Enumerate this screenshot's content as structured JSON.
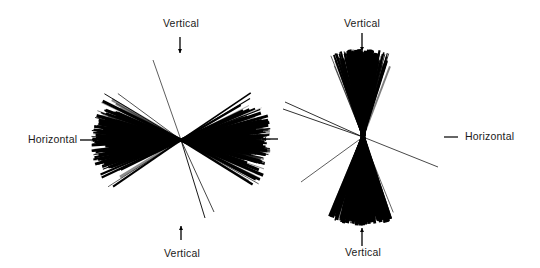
{
  "figure": {
    "panels": [
      {
        "id": "left",
        "description": "Rose diagram of line orientations concentrated near horizontal",
        "center": [
          181,
          140
        ],
        "radius": 86,
        "dominant_orientation": "Horizontal",
        "labels": {
          "top": "Vertical",
          "bottom": "Vertical",
          "left": "Horizontal"
        }
      },
      {
        "id": "right",
        "description": "Rose diagram of line orientations concentrated near vertical",
        "center": [
          363,
          137
        ],
        "radius": 86,
        "dominant_orientation": "Vertical",
        "labels": {
          "top": "Vertical",
          "bottom": "Vertical",
          "right": "Horizontal"
        }
      }
    ],
    "colors": {
      "ink": "#000000",
      "background": "#ffffff",
      "text": "#1a1a1a"
    }
  }
}
